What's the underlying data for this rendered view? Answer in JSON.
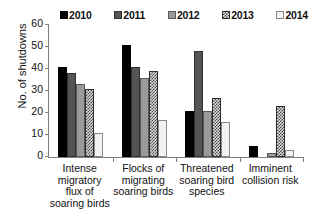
{
  "chart_data": {
    "type": "bar",
    "title": "",
    "xlabel": "",
    "ylabel": "No. of shutdowns",
    "ylim": [
      0,
      60
    ],
    "yticks": [
      0,
      10,
      20,
      30,
      40,
      50,
      60
    ],
    "grid": false,
    "legend_position": "top",
    "categories": [
      "Intense migratory flux of soaring birds",
      "Flocks of migrating soaring birds",
      "Threatened soaring bird species",
      "Imminent collision risk"
    ],
    "category_lines": [
      [
        "Intense",
        "migratory",
        "flux of",
        "soaring birds"
      ],
      [
        "Flocks of",
        "migrating",
        "soaring birds"
      ],
      [
        "Threatened",
        "soaring bird",
        "species"
      ],
      [
        "Imminent",
        "collision risk"
      ]
    ],
    "series": [
      {
        "name": "2010",
        "color": "#000000",
        "pattern": "solid-black",
        "values": [
          41,
          51,
          21,
          5
        ]
      },
      {
        "name": "2011",
        "color": "#545454",
        "pattern": "solid-dark-gray",
        "values": [
          38,
          41,
          48,
          0
        ]
      },
      {
        "name": "2012",
        "color": "#9a9a9a",
        "pattern": "solid-mid-gray",
        "values": [
          33,
          36,
          21,
          2
        ]
      },
      {
        "name": "2013",
        "color": "#4a4a4a",
        "pattern": "checkered",
        "values": [
          31,
          39,
          27,
          23
        ]
      },
      {
        "name": "2014",
        "color": "#f2f2f2",
        "pattern": "open-white",
        "values": [
          11,
          17,
          16,
          3
        ]
      }
    ]
  }
}
